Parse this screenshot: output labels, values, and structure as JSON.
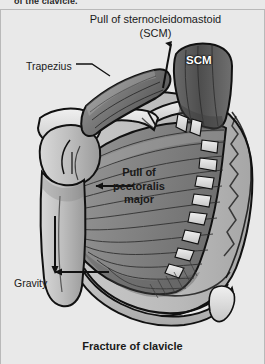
{
  "figure": {
    "clipped_header": "of the clavicle.",
    "caption": "Fracture of clavicle",
    "background_color": "#e9e9e9",
    "width": 265,
    "height": 364
  },
  "labels": {
    "scm_pull_line1": "Pull of sternocleidomastoid",
    "scm_pull_line2": "(SCM)",
    "trapezius": "Trapezius",
    "scm_muscle": "SCM",
    "pectoralis_line1": "Pull of",
    "pectoralis_line2": "pectoralis",
    "pectoralis_line3": "major",
    "gravity": "Gravity"
  },
  "colors": {
    "background": "#e9e9e9",
    "outline": "#111111",
    "muscle_mid": "#8d8d8d",
    "muscle_dark": "#5e5e5e",
    "muscle_light": "#b4b4b4",
    "bone_light": "#e6e6e6",
    "bone_shadow": "#c2c2c2",
    "skin": "#c9c9c9",
    "text": "#1a1a1a",
    "label_white": "#ffffff"
  },
  "force_arrows": [
    {
      "name": "scm-pull-arrow",
      "direction": "up",
      "label": "Pull of sternocleidomastoid (SCM)"
    },
    {
      "name": "pectoralis-pull-arrow",
      "direction": "left",
      "label": "Pull of pectoralis major"
    },
    {
      "name": "gravity-arrow",
      "direction": "down",
      "label": "Gravity"
    }
  ],
  "anatomy": [
    {
      "name": "clavicle",
      "note": "fractured, two fragments"
    },
    {
      "name": "sternocleidomastoid"
    },
    {
      "name": "trapezius"
    },
    {
      "name": "pectoralis-major"
    },
    {
      "name": "humerus"
    },
    {
      "name": "scapula"
    },
    {
      "name": "rib-cage"
    },
    {
      "name": "sternum"
    }
  ]
}
